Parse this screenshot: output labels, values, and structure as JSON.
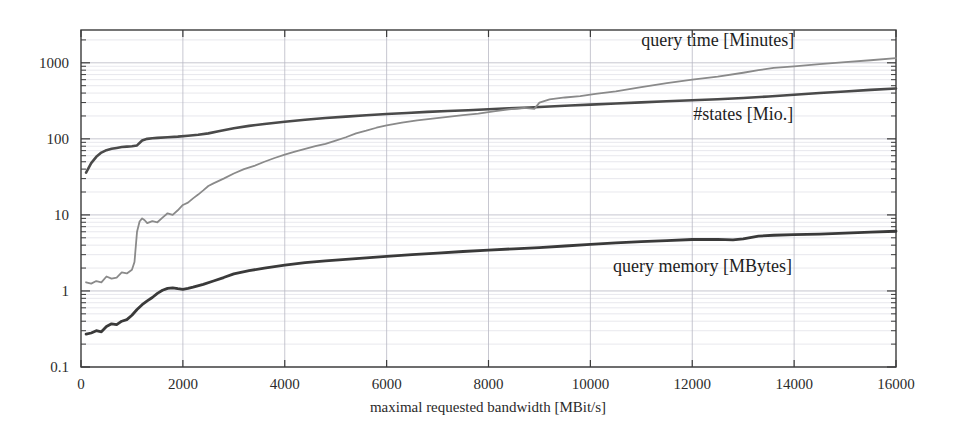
{
  "chart_data": {
    "type": "line",
    "title": "",
    "xlabel": "maximal requested bandwidth [MBit/s]",
    "ylabel": "",
    "yscale": "log",
    "xlim": [
      0,
      16000
    ],
    "ylim": [
      0.1,
      2700
    ],
    "grid": true,
    "legend_position": "inline-annotations",
    "xticks": [
      "0",
      "2000",
      "4000",
      "6000",
      "8000",
      "10000",
      "12000",
      "14000",
      "16000"
    ],
    "xtick_values": [
      0,
      2000,
      4000,
      6000,
      8000,
      10000,
      12000,
      14000,
      16000
    ],
    "yticks": [
      "0.1",
      "1",
      "10",
      "100",
      "1000"
    ],
    "ytick_values": [
      0.1,
      1,
      10,
      100,
      1000
    ],
    "series": [
      {
        "name": "#states [Mio.]",
        "color": "#4a4a4a",
        "width": 2.6,
        "annotation": "#states [Mio.]",
        "annotation_x": 13000,
        "annotation_y": 175,
        "x": [
          100,
          200,
          300,
          400,
          500,
          600,
          700,
          800,
          900,
          1000,
          1100,
          1200,
          1300,
          1400,
          1500,
          1700,
          1900,
          2100,
          2300,
          2500,
          2700,
          3000,
          3300,
          3600,
          4000,
          4400,
          4800,
          5200,
          5600,
          6000,
          6400,
          6800,
          7200,
          7600,
          8000,
          8400,
          8800,
          9200,
          9600,
          10000,
          10500,
          11000,
          11500,
          12000,
          12500,
          13000,
          13500,
          14000,
          14500,
          15000,
          15500,
          16000
        ],
        "y": [
          36,
          48,
          58,
          66,
          71,
          74,
          76,
          78,
          79,
          80,
          82,
          95,
          100,
          102,
          103,
          105,
          107,
          110,
          113,
          118,
          126,
          138,
          148,
          157,
          168,
          178,
          188,
          196,
          204,
          212,
          219,
          226,
          232,
          238,
          245,
          252,
          258,
          266,
          274,
          282,
          292,
          302,
          312,
          322,
          332,
          345,
          360,
          380,
          400,
          420,
          440,
          460
        ]
      },
      {
        "name": "query time [Minutes]",
        "color": "#8a8a8a",
        "width": 1.8,
        "annotation": "query time [Minutes]",
        "annotation_x": 12500,
        "annotation_y": 1650,
        "x": [
          100,
          200,
          300,
          400,
          500,
          600,
          700,
          800,
          900,
          1000,
          1050,
          1100,
          1150,
          1200,
          1250,
          1300,
          1400,
          1500,
          1600,
          1700,
          1800,
          1900,
          2000,
          2100,
          2200,
          2300,
          2400,
          2500,
          2600,
          2800,
          3000,
          3200,
          3400,
          3600,
          3800,
          4000,
          4200,
          4400,
          4600,
          4800,
          5000,
          5200,
          5400,
          5600,
          5800,
          6000,
          6300,
          6600,
          6900,
          7200,
          7500,
          7800,
          8100,
          8400,
          8700,
          8900,
          9000,
          9200,
          9500,
          9800,
          10100,
          10500,
          11000,
          11500,
          12000,
          12500,
          13000,
          13300,
          13600,
          14000,
          14500,
          15000,
          15500,
          16000
        ],
        "y": [
          1.3,
          1.25,
          1.35,
          1.3,
          1.55,
          1.45,
          1.5,
          1.75,
          1.7,
          1.9,
          2.4,
          6.0,
          8.2,
          9.0,
          8.5,
          7.8,
          8.3,
          8.0,
          9.2,
          10.5,
          10.0,
          11.5,
          13.5,
          14.5,
          16.5,
          18.5,
          21,
          24,
          26,
          30,
          35,
          40,
          44,
          50,
          56,
          62,
          68,
          74,
          80,
          86,
          95,
          105,
          118,
          128,
          140,
          150,
          163,
          175,
          185,
          195,
          205,
          215,
          230,
          245,
          255,
          248,
          300,
          330,
          350,
          365,
          390,
          420,
          480,
          540,
          600,
          660,
          740,
          800,
          860,
          900,
          960,
          1020,
          1080,
          1150
        ]
      },
      {
        "name": "query memory [MBytes]",
        "color": "#3a3a3a",
        "width": 2.8,
        "annotation": "query memory [MBytes]",
        "annotation_x": 12200,
        "annotation_y": 1.75,
        "x": [
          100,
          200,
          300,
          400,
          500,
          600,
          700,
          800,
          900,
          1000,
          1100,
          1200,
          1300,
          1400,
          1500,
          1600,
          1700,
          1800,
          1900,
          2000,
          2100,
          2200,
          2400,
          2600,
          2800,
          3000,
          3300,
          3600,
          4000,
          4400,
          4800,
          5200,
          5600,
          6000,
          6500,
          7000,
          7500,
          8000,
          8500,
          9000,
          9500,
          10000,
          10500,
          11000,
          11500,
          12000,
          12500,
          12800,
          13000,
          13300,
          13600,
          14000,
          14500,
          15000,
          15500,
          16000
        ],
        "y": [
          0.27,
          0.28,
          0.3,
          0.29,
          0.34,
          0.37,
          0.36,
          0.4,
          0.42,
          0.48,
          0.57,
          0.66,
          0.74,
          0.82,
          0.93,
          1.02,
          1.08,
          1.1,
          1.07,
          1.05,
          1.08,
          1.12,
          1.22,
          1.35,
          1.5,
          1.68,
          1.85,
          2.0,
          2.18,
          2.35,
          2.48,
          2.6,
          2.72,
          2.85,
          3.0,
          3.15,
          3.3,
          3.45,
          3.58,
          3.72,
          3.9,
          4.1,
          4.3,
          4.45,
          4.6,
          4.75,
          4.78,
          4.7,
          4.85,
          5.25,
          5.4,
          5.5,
          5.6,
          5.75,
          5.95,
          6.1
        ]
      }
    ]
  },
  "annotations": {
    "query_time": "query time [Minutes]",
    "states": "#states [Mio.]",
    "query_memory": "query memory [MBytes]"
  },
  "axes": {
    "x_title": "maximal requested bandwidth [MBit/s]"
  }
}
